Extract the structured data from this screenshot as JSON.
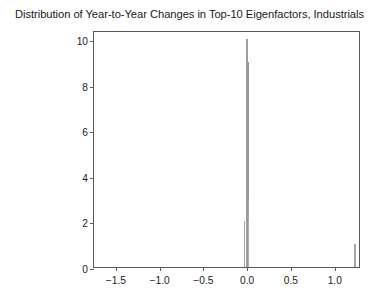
{
  "chart_data": {
    "type": "bar",
    "title": "Distribution of Year-to-Year Changes in Top-10 Eigenfactors, Industrials",
    "xlabel": "",
    "ylabel": "",
    "xlim": [
      -1.75,
      1.3
    ],
    "ylim": [
      0,
      10.4
    ],
    "xticks": [
      -1.5,
      -1.0,
      -0.5,
      0.0,
      0.5,
      1.0
    ],
    "xtick_labels": [
      "−1.5",
      "−1.0",
      "−0.5",
      "0.0",
      "0.5",
      "1.0"
    ],
    "yticks": [
      0,
      2,
      4,
      6,
      8,
      10
    ],
    "ytick_labels": [
      "0",
      "2",
      "4",
      "6",
      "8",
      "10"
    ],
    "grid": false,
    "legend": null,
    "bar_color": "#8c8c8c",
    "bar_edge_color": "#404040",
    "frame_color": "#595959",
    "background": "#ffffff",
    "bins": [
      {
        "x": -0.035,
        "value": 2,
        "width": 0.008,
        "color": "#a6a6a6"
      },
      {
        "x": -0.003,
        "value": 10,
        "width": 0.006,
        "color": "#9e9e9e"
      },
      {
        "x": 0.0,
        "value": 7,
        "width": 0.007,
        "color": "#4d4d4d"
      },
      {
        "x": 0.009,
        "value": 9,
        "width": 0.009,
        "color": "#9a9a9a"
      },
      {
        "x": 0.012,
        "value": 3,
        "width": 0.005,
        "color": "#a6a6a6"
      },
      {
        "x": 0.018,
        "value": 2,
        "width": 0.008,
        "color": "#b0b0b0"
      },
      {
        "x": 1.232,
        "value": 1,
        "width": 0.006,
        "color": "#a6a6a6"
      }
    ]
  }
}
